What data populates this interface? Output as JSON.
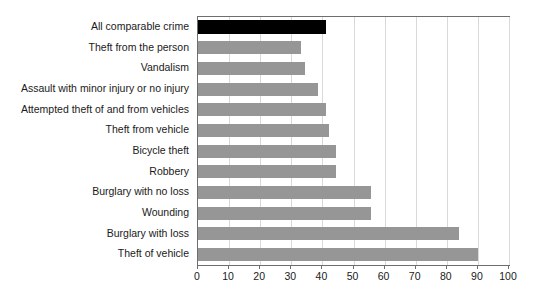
{
  "chart_data": {
    "type": "bar",
    "orientation": "horizontal",
    "title": "",
    "subtitle": "",
    "xlabel": "",
    "ylabel": "",
    "xlim": [
      0,
      100
    ],
    "xticks": [
      0,
      10,
      20,
      30,
      40,
      50,
      60,
      70,
      80,
      90,
      100
    ],
    "xtick_labels": [
      "0",
      "10",
      "20",
      "30",
      "40",
      "50",
      "60",
      "70",
      "80",
      "90",
      "100"
    ],
    "grid": true,
    "grid_axis": "x",
    "legend": false,
    "legend_position": "none",
    "categories": [
      "All comparable crime",
      "Theft from the person",
      "Vandalism",
      "Assault with minor injury or no injury",
      "Attempted theft of and from vehicles",
      "Theft from vehicle",
      "Bicycle theft",
      "Robbery",
      "Burglary with no loss",
      "Wounding",
      "Burglary with loss",
      "Theft of vehicle"
    ],
    "values": [
      41,
      33,
      34.5,
      38.5,
      41,
      42,
      44.5,
      44.5,
      55.5,
      55.5,
      84,
      90
    ],
    "bar_colors": [
      "#000000",
      "#969696",
      "#969696",
      "#969696",
      "#969696",
      "#969696",
      "#969696",
      "#969696",
      "#969696",
      "#969696",
      "#969696",
      "#969696"
    ],
    "highlight_index": 0,
    "colors": {
      "highlight": "#000000",
      "bar": "#969696",
      "gridline": "#d9d9d9",
      "axis": "#6e6e6e",
      "text": "#1a1a1a",
      "background": "#ffffff"
    }
  }
}
